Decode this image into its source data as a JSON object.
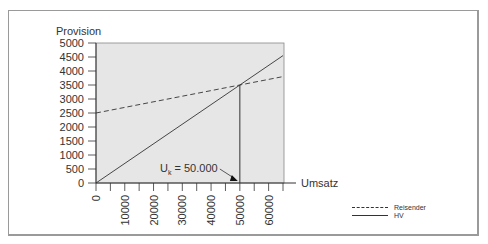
{
  "chart_data": {
    "type": "line",
    "title": "",
    "xlabel": "Umsatz",
    "ylabel": "Provision",
    "xlim": [
      0,
      65000
    ],
    "ylim": [
      0,
      5000
    ],
    "x_ticks": [
      "0",
      "10000",
      "20000",
      "30000",
      "40000",
      "50000",
      "60000"
    ],
    "y_ticks": [
      "0",
      "500",
      "1000",
      "1500",
      "2000",
      "2500",
      "3000",
      "3500",
      "4000",
      "4500",
      "5000"
    ],
    "grid": false,
    "series": [
      {
        "name": "Reisender",
        "style": "dashed",
        "x": [
          0,
          50000,
          65000
        ],
        "y": [
          2500,
          3500,
          3800
        ]
      },
      {
        "name": "HV",
        "style": "solid",
        "x": [
          0,
          50000,
          65000
        ],
        "y": [
          0,
          3500,
          4550
        ]
      }
    ],
    "annotations": [
      {
        "text": "Uk = 50.000",
        "main": "U",
        "sub": "k",
        "rest": " = 50.000",
        "x": 50000,
        "y": 0
      }
    ],
    "legend_position": "bottom-right",
    "colors": {
      "plot_bg": "#e6e6e6",
      "line": "#333333",
      "frame": "#9a9a9a"
    }
  }
}
